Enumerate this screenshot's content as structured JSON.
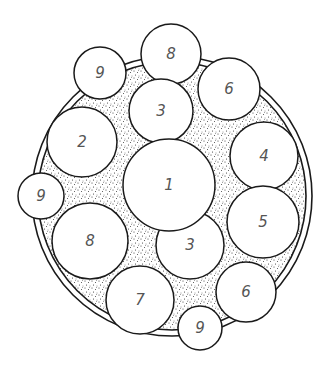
{
  "figure": {
    "colors": {
      "line": "#1a1a1a",
      "label": "#555555",
      "stipple": "#333333",
      "background": "#ffffff"
    },
    "outer_ring": {
      "cx": 172,
      "cy": 196,
      "r": 140,
      "inner_r": 134
    },
    "circles": [
      {
        "id": "c8-top",
        "label": "8",
        "cx": 171,
        "cy": 54,
        "r": 30
      },
      {
        "id": "c9-top",
        "label": "9",
        "cx": 100,
        "cy": 73,
        "r": 26
      },
      {
        "id": "c6-top",
        "label": "6",
        "cx": 229,
        "cy": 89,
        "r": 31
      },
      {
        "id": "c3-top",
        "label": "3",
        "cx": 161,
        "cy": 111,
        "r": 32
      },
      {
        "id": "c2",
        "label": "2",
        "cx": 82,
        "cy": 142,
        "r": 35
      },
      {
        "id": "c4",
        "label": "4",
        "cx": 264,
        "cy": 156,
        "r": 34
      },
      {
        "id": "c9-left",
        "label": "9",
        "cx": 41,
        "cy": 196,
        "r": 23
      },
      {
        "id": "c5",
        "label": "5",
        "cx": 263,
        "cy": 222,
        "r": 36
      },
      {
        "id": "c8-left",
        "label": "8",
        "cx": 90,
        "cy": 241,
        "r": 38
      },
      {
        "id": "c3-bottom",
        "label": "3",
        "cx": 190,
        "cy": 245,
        "r": 34
      },
      {
        "id": "c1",
        "label": "1",
        "cx": 169,
        "cy": 185,
        "r": 46
      },
      {
        "id": "c7",
        "label": "7",
        "cx": 140,
        "cy": 300,
        "r": 34
      },
      {
        "id": "c6-bottom",
        "label": "6",
        "cx": 246,
        "cy": 292,
        "r": 30
      },
      {
        "id": "c9-bottom",
        "label": "9",
        "cx": 200,
        "cy": 328,
        "r": 22
      }
    ]
  }
}
